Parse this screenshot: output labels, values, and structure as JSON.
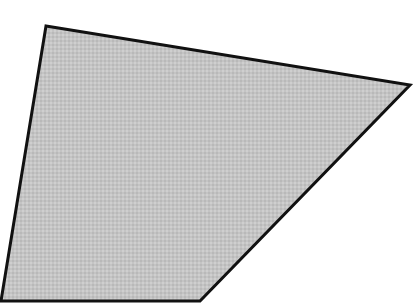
{
  "diagram": {
    "type": "quadrilateral",
    "canvas": {
      "width": 416,
      "height": 303,
      "background": "#ffffff"
    },
    "shape": {
      "points": [
        [
          46,
          26
        ],
        [
          410,
          85
        ],
        [
          200,
          301
        ],
        [
          1,
          301
        ]
      ],
      "fill": "#c4c4c4",
      "stroke": "#111111",
      "stroke_width": 3,
      "texture": "dotted-halftone"
    }
  }
}
